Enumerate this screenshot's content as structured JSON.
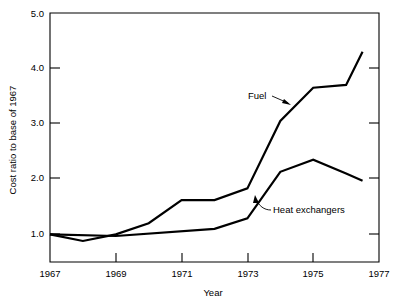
{
  "chart_data": {
    "type": "line",
    "title": "",
    "xlabel": "Year",
    "ylabel": "Cost ratio to base of 1967",
    "xlim": [
      1967,
      1977
    ],
    "ylim": [
      0.5,
      5.0
    ],
    "grid": false,
    "legend_position": "inline-annotations",
    "x_ticks": [
      "1967",
      "1969",
      "1971",
      "1973",
      "1975",
      "1977"
    ],
    "x_tick_values": [
      1967,
      1969,
      1971,
      1973,
      1975,
      1977
    ],
    "y_ticks": [
      "1.0",
      "2.0",
      "3.0",
      "4.0",
      "5.0"
    ],
    "y_tick_values": [
      1.0,
      2.0,
      3.0,
      4.0,
      5.0
    ],
    "series": [
      {
        "name": "Fuel",
        "label": "Fuel",
        "color": "#000000",
        "x": [
          1967,
          1968,
          1969,
          1970,
          1971,
          1972,
          1973,
          1974,
          1975,
          1976,
          1976.5
        ],
        "values": [
          1.0,
          0.88,
          1.0,
          1.2,
          1.62,
          1.62,
          1.83,
          3.05,
          3.65,
          3.7,
          4.3
        ]
      },
      {
        "name": "Heat exchangers",
        "label": "Heat exchangers",
        "color": "#000000",
        "x": [
          1967,
          1969,
          1972,
          1973,
          1974,
          1975,
          1976,
          1976.5
        ],
        "values": [
          1.0,
          0.97,
          1.1,
          1.29,
          2.13,
          2.35,
          2.1,
          1.97
        ]
      }
    ],
    "annotations": [
      {
        "text": "Fuel",
        "x": 1974.0,
        "y": 3.55
      },
      {
        "text": "Heat exchangers",
        "x": 1975.0,
        "y": 1.6
      }
    ]
  }
}
